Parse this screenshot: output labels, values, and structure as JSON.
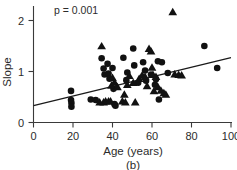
{
  "chart_data": {
    "type": "scatter",
    "title": "",
    "xlabel": "Age (years)",
    "ylabel": "Slope",
    "xlim": [
      0,
      100
    ],
    "ylim": [
      0,
      2.3
    ],
    "xticks": [
      0,
      20,
      40,
      60,
      80,
      100
    ],
    "yticks": [
      0,
      1,
      2
    ],
    "xtick_labels": [
      "0",
      "20",
      "40",
      "60",
      "80",
      "100"
    ],
    "ytick_labels": [
      "0",
      "1",
      "2"
    ],
    "grid": false,
    "legend": null,
    "annotations": [
      {
        "name": "p-value",
        "text": "p = 0.001",
        "x": 24,
        "y": 2.23
      }
    ],
    "panel_label": "(b)",
    "series": [
      {
        "name": "circles",
        "marker": "circle",
        "color": "#111111",
        "points": [
          [
            19.0,
            0.62
          ],
          [
            19.0,
            0.44
          ],
          [
            19.2,
            0.38
          ],
          [
            19.2,
            0.31
          ],
          [
            29.0,
            0.45
          ],
          [
            31.5,
            0.44
          ],
          [
            34.5,
            1.26
          ],
          [
            35.5,
            1.06
          ],
          [
            36.0,
            0.94
          ],
          [
            37.5,
            1.15
          ],
          [
            38.0,
            0.96
          ],
          [
            38.5,
            0.86
          ],
          [
            40.0,
            1.07
          ],
          [
            40.5,
            0.66
          ],
          [
            41.0,
            0.36
          ],
          [
            41.5,
            0.33
          ],
          [
            45.5,
            1.27
          ],
          [
            47.0,
            0.83
          ],
          [
            47.5,
            0.98
          ],
          [
            50.5,
            1.45
          ],
          [
            51.0,
            1.12
          ],
          [
            53.0,
            0.78
          ],
          [
            55.5,
            1.18
          ],
          [
            56.5,
            1.02
          ],
          [
            57.0,
            0.82
          ],
          [
            59.5,
            0.94
          ],
          [
            61.5,
            0.74
          ],
          [
            62.0,
            0.85
          ],
          [
            63.0,
            1.2
          ],
          [
            65.0,
            1.18
          ],
          [
            63.5,
            0.45
          ],
          [
            68.0,
            0.97
          ],
          [
            86.5,
            1.5
          ],
          [
            93.0,
            1.07
          ]
        ]
      },
      {
        "name": "triangles",
        "marker": "triangle",
        "color": "#111111",
        "points": [
          [
            34.5,
            1.5
          ],
          [
            33.5,
            0.4
          ],
          [
            35.5,
            0.4
          ],
          [
            36.5,
            0.42
          ],
          [
            38.0,
            0.42
          ],
          [
            39.0,
            0.42
          ],
          [
            39.5,
            0.73
          ],
          [
            40.0,
            0.88
          ],
          [
            41.0,
            0.79
          ],
          [
            42.5,
            0.7
          ],
          [
            45.0,
            0.42
          ],
          [
            46.0,
            0.55
          ],
          [
            46.5,
            0.4
          ],
          [
            47.5,
            0.74
          ],
          [
            48.5,
            0.92
          ],
          [
            50.5,
            0.78
          ],
          [
            51.5,
            0.4
          ],
          [
            53.5,
            0.86
          ],
          [
            55.0,
            0.93
          ],
          [
            56.5,
            0.9
          ],
          [
            57.5,
            0.72
          ],
          [
            58.5,
            1.45
          ],
          [
            59.5,
            1.4
          ],
          [
            60.0,
            1.08
          ],
          [
            60.5,
            0.94
          ],
          [
            61.0,
            0.62
          ],
          [
            62.0,
            0.9
          ],
          [
            63.0,
            0.7
          ],
          [
            64.5,
            0.63
          ],
          [
            66.0,
            0.58
          ],
          [
            67.0,
            0.55
          ],
          [
            70.5,
            2.17
          ],
          [
            71.5,
            0.95
          ],
          [
            73.5,
            0.94
          ],
          [
            75.0,
            0.93
          ]
        ]
      }
    ],
    "fit_line": {
      "name": "regression-line",
      "x": [
        0,
        100
      ],
      "y": [
        0.33,
        1.27
      ]
    }
  }
}
